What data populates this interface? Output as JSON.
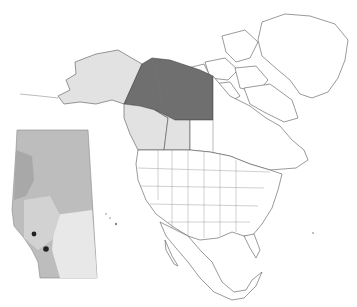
{
  "map": {
    "type": "locator-map",
    "region": "North America",
    "highlight_colors": {
      "dark": "#6f6f6f",
      "light": "#e2e2e2",
      "base": "#ffffff",
      "outline": "#555555"
    },
    "highlighted_regions": [
      {
        "name": "Yukon",
        "shade": "dark"
      },
      {
        "name": "Northwest Territories (mainland)",
        "shade": "dark"
      },
      {
        "name": "Alaska",
        "shade": "light"
      },
      {
        "name": "British Columbia",
        "shade": "light"
      },
      {
        "name": "Alberta",
        "shade": "light"
      }
    ],
    "inset": {
      "region": "Alberta",
      "description": "Grayscale shaded relief/ecoregion inset with two dark point markers in the southwest",
      "markers": 2
    }
  }
}
